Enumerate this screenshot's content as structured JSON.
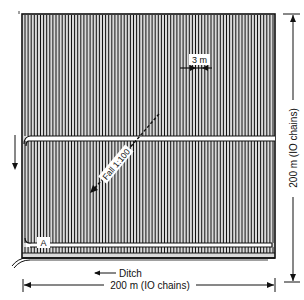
{
  "diagram": {
    "scale_label": "3 m",
    "fall_label": "Fall 1:100",
    "ditch_label": "Ditch",
    "corner_label": "A",
    "width_label": "200 m (IO chains)",
    "height_label": "200 m (IO chains)",
    "colors": {
      "ink": "#111111",
      "background": "#ffffff",
      "furrow_fill": "#d9d9d9"
    }
  }
}
